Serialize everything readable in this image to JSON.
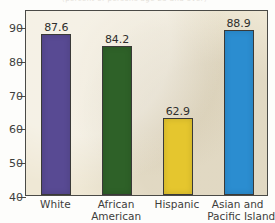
{
  "figure": {
    "title_bleed": "(percent of persons age 25 and over)",
    "background_color": "#efe8d5",
    "frame_color": "#4a4a46"
  },
  "chart_data": {
    "type": "bar",
    "title": "",
    "xlabel": "",
    "ylabel": "",
    "ylim": [
      40,
      95
    ],
    "yticks": [
      40,
      50,
      60,
      70,
      80,
      90
    ],
    "ytick_labels": [
      "40",
      "50",
      "60",
      "70",
      "80",
      "90"
    ],
    "grid": false,
    "legend": "none",
    "categories": [
      "White",
      "African American",
      "Hispanic",
      "Asian and Pacific Islander"
    ],
    "category_lines": [
      [
        "White"
      ],
      [
        "African",
        "American"
      ],
      [
        "Hispanic"
      ],
      [
        "Asian and",
        "Pacific Islander"
      ]
    ],
    "values": [
      87.6,
      84.2,
      62.9,
      88.9
    ],
    "value_labels": [
      "87.6",
      "84.2",
      "62.9",
      "88.9"
    ],
    "bar_colors": [
      "#584a93",
      "#2e6128",
      "#e5c62e",
      "#2b8dd0"
    ],
    "bar_edge_color": "#3a3a38"
  }
}
